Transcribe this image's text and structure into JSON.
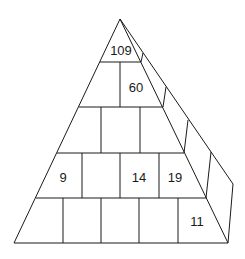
{
  "diagram": {
    "type": "number-pyramid",
    "rows": [
      {
        "row": 1,
        "cells": [
          "109"
        ]
      },
      {
        "row": 2,
        "cells": [
          "",
          "60"
        ]
      },
      {
        "row": 3,
        "cells": [
          "",
          "",
          ""
        ]
      },
      {
        "row": 4,
        "cells": [
          "9",
          "",
          "14",
          "19"
        ]
      },
      {
        "row": 5,
        "cells": [
          "",
          "",
          "",
          "",
          "11"
        ]
      }
    ],
    "colors": {
      "line": "#1a1a1a",
      "background": "#ffffff",
      "text": "#1a1a1a"
    }
  }
}
